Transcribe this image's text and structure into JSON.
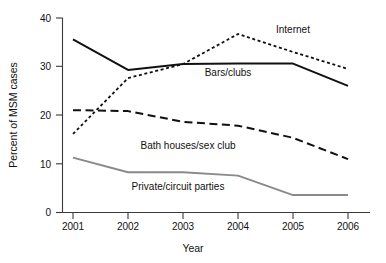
{
  "chart_data": {
    "type": "line",
    "title": "",
    "subtitle": "",
    "xlabel": "Year",
    "ylabel": "Percent of MSM cases",
    "categories": [
      "2001",
      "2002",
      "2003",
      "2004",
      "2005",
      "2006"
    ],
    "x": [
      2001,
      2002,
      2003,
      2004,
      2005,
      2006
    ],
    "xlim": [
      2001,
      2006
    ],
    "ylim": [
      0,
      40
    ],
    "y_ticks": [
      "0",
      "10",
      "20",
      "30",
      "40"
    ],
    "y_tick_values": [
      0,
      10,
      20,
      30,
      40
    ],
    "x_ticks": [
      "2001",
      "2002",
      "2003",
      "2004",
      "2005",
      "2006"
    ],
    "grid": false,
    "legend_position": "inline-annotations",
    "series": [
      {
        "name": "Internet",
        "style": "dotted",
        "color": "#111111",
        "values": [
          16.1,
          27.6,
          30.5,
          36.7,
          33.0,
          29.5
        ],
        "label": "Internet"
      },
      {
        "name": "Bars/clubs",
        "style": "solid",
        "color": "#111111",
        "values": [
          35.6,
          29.3,
          30.5,
          30.6,
          30.6,
          26.0
        ],
        "label": "Bars/clubs"
      },
      {
        "name": "Bath houses/sex club",
        "style": "dashed",
        "color": "#111111",
        "values": [
          21.0,
          20.8,
          18.6,
          17.8,
          15.3,
          10.9
        ],
        "label": "Bath houses/sex club"
      },
      {
        "name": "Private/circuit parties",
        "style": "solid-gray",
        "color": "#8a8a8a",
        "values": [
          11.2,
          8.2,
          8.2,
          7.5,
          3.5,
          3.5
        ],
        "label": "Private/circuit parties"
      }
    ],
    "annotations": [
      {
        "text": "Internet",
        "x": 2004.85,
        "y": 37.3
      },
      {
        "text": "Bars/clubs",
        "x": 2003.1,
        "y": 27.5
      },
      {
        "text": "Bath houses/sex club",
        "x": 2001.95,
        "y": 13.6
      },
      {
        "text": "Private/circuit parties",
        "x": 2001.85,
        "y": 4.9
      }
    ]
  },
  "axes": {
    "y_axis_title": "Percent of MSM cases",
    "x_axis_title": "Year"
  }
}
